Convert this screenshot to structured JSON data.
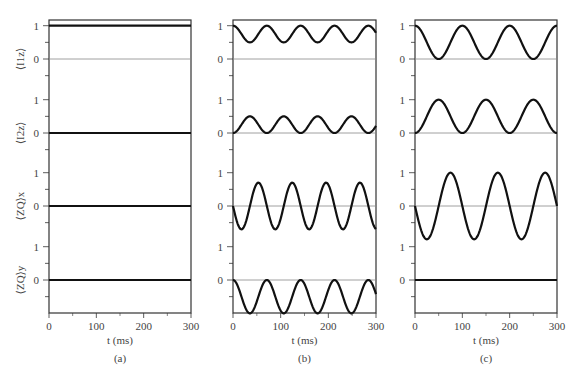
{
  "chart_data": [
    {
      "type": "line",
      "panel_label": "(a)",
      "xlabel": "t (ms)",
      "x_ticks": [
        "0",
        "100",
        "200",
        "300"
      ],
      "xlim": [
        0,
        300
      ],
      "subplots": [
        {
          "ylabel": "⟨I1z⟩",
          "y_ticks": [
            "1",
            "0"
          ],
          "series": {
            "name": "I1z",
            "offset": 1.0,
            "amplitude": 0.0,
            "period_ms": 70,
            "form": "cos"
          }
        },
        {
          "ylabel": "⟨I2z⟩",
          "y_ticks": [
            "1",
            "0"
          ],
          "series": {
            "name": "I2z",
            "offset": 0.0,
            "amplitude": 0.0,
            "period_ms": 70,
            "form": "cos"
          }
        },
        {
          "ylabel": "⟨ZQ⟩x",
          "y_ticks": [
            "1",
            "0"
          ],
          "series": {
            "name": "ZQx",
            "offset": 0.0,
            "amplitude": 0.0,
            "period_ms": 70,
            "form": "sin"
          }
        },
        {
          "ylabel": "⟨ZQ⟩y",
          "y_ticks": [
            "1",
            "0"
          ],
          "series": {
            "name": "ZQy",
            "offset": 0.0,
            "amplitude": 0.0,
            "period_ms": 70,
            "form": "cos"
          }
        }
      ]
    },
    {
      "type": "line",
      "panel_label": "(b)",
      "xlabel": "t (ms)",
      "x_ticks": [
        "0",
        "100",
        "200",
        "300"
      ],
      "xlim": [
        0,
        300
      ],
      "subplots": [
        {
          "ylabel": "",
          "y_ticks": [
            "1",
            "0"
          ],
          "series": {
            "name": "I1z",
            "offset": 0.75,
            "amplitude": 0.25,
            "period_ms": 71,
            "form": "cos"
          }
        },
        {
          "ylabel": "",
          "y_ticks": [
            "1",
            "0"
          ],
          "series": {
            "name": "I2z",
            "offset": 0.25,
            "amplitude": -0.25,
            "period_ms": 71,
            "form": "cos"
          }
        },
        {
          "ylabel": "",
          "y_ticks": [
            "1",
            "0"
          ],
          "series": {
            "name": "ZQx",
            "offset": 0.0,
            "amplitude": -0.7,
            "period_ms": 71,
            "form": "sin"
          }
        },
        {
          "ylabel": "",
          "y_ticks": [
            "1",
            "0"
          ],
          "series": {
            "name": "ZQy",
            "offset": -0.5,
            "amplitude": 0.5,
            "period_ms": 71,
            "form": "cos"
          }
        }
      ]
    },
    {
      "type": "line",
      "panel_label": "(c)",
      "xlabel": "t (ms)",
      "x_ticks": [
        "0",
        "100",
        "200",
        "300"
      ],
      "xlim": [
        0,
        300
      ],
      "subplots": [
        {
          "ylabel": "",
          "y_ticks": [
            "1",
            "0"
          ],
          "series": {
            "name": "I1z",
            "offset": 0.5,
            "amplitude": 0.5,
            "period_ms": 100,
            "form": "cos"
          }
        },
        {
          "ylabel": "",
          "y_ticks": [
            "1",
            "0"
          ],
          "series": {
            "name": "I2z",
            "offset": 0.5,
            "amplitude": -0.5,
            "period_ms": 100,
            "form": "cos"
          }
        },
        {
          "ylabel": "",
          "y_ticks": [
            "1",
            "0"
          ],
          "series": {
            "name": "ZQx",
            "offset": 0.0,
            "amplitude": -1.0,
            "period_ms": 100,
            "form": "sin"
          }
        },
        {
          "ylabel": "",
          "y_ticks": [
            "1",
            "0"
          ],
          "series": {
            "name": "ZQy",
            "offset": 0.0,
            "amplitude": 0.0,
            "period_ms": 100,
            "form": "cos"
          }
        }
      ]
    }
  ],
  "ylabels": [
    "⟨I1z⟩",
    "⟨I2z⟩",
    "⟨ZQ⟩x",
    "⟨ZQ⟩y"
  ],
  "colors": {
    "curve": "#111111",
    "axis": "#333333",
    "zero_line": "#888888"
  }
}
